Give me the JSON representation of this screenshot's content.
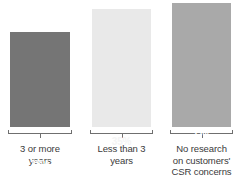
{
  "chart_data": {
    "type": "bar",
    "title": "",
    "subtitle": "",
    "xlabel": "",
    "ylabel": "",
    "grid": false,
    "legend": "none",
    "axis_visible": false,
    "value_label_suffix": "%",
    "ylim": [
      0,
      40
    ],
    "categories": [
      "3 or more\nyears",
      "Less than 3\nyears",
      "No research\non customers'\nCSR concerns"
    ],
    "values": [
      28,
      35,
      37
    ],
    "value_labels": [
      "28%",
      "35%",
      "37%"
    ],
    "colors": [
      "#757575",
      "#e9e9e9",
      "#a9a9a9"
    ],
    "bars": [
      {
        "category": "3 or more\nyears",
        "value": 28,
        "value_label": "28%",
        "color": "#757575"
      },
      {
        "category": "Less than 3\nyears",
        "value": 35,
        "value_label": "35%",
        "color": "#e9e9e9"
      },
      {
        "category": "No research\non customers'\nCSR concerns",
        "value": 37,
        "value_label": "37%",
        "color": "#a9a9a9"
      }
    ]
  },
  "style": {
    "background": "#ffffff",
    "bracket_color": "#6f6f6f",
    "label_color": "#3a3a3a",
    "value_label_color": "#ffffff"
  }
}
